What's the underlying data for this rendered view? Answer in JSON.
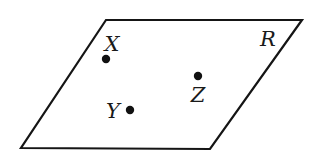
{
  "diagram": {
    "type": "plane-with-points",
    "plane": {
      "label": "R",
      "vertices": [
        [
          106,
          20
        ],
        [
          302,
          20
        ],
        [
          210,
          149
        ],
        [
          21,
          148
        ]
      ],
      "label_pos": [
        268,
        46
      ],
      "stroke_color": "#151515"
    },
    "points": [
      {
        "name": "X",
        "label": "X",
        "dot": [
          106,
          59
        ],
        "label_pos": [
          112,
          51
        ]
      },
      {
        "name": "Y",
        "label": "Y",
        "dot": [
          130,
          110
        ],
        "label_pos": [
          113,
          118
        ]
      },
      {
        "name": "Z",
        "label": "Z",
        "dot": [
          198,
          76
        ],
        "label_pos": [
          198,
          102
        ]
      }
    ],
    "point_color": "#111111"
  }
}
